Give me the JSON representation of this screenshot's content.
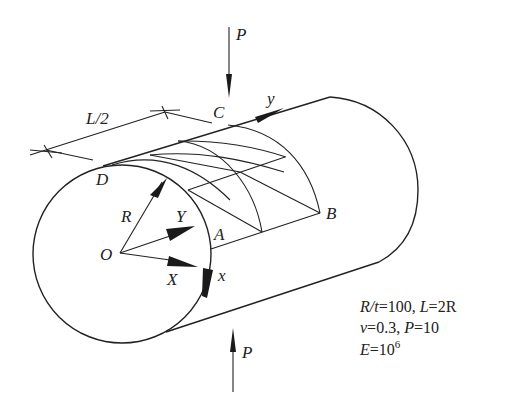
{
  "diagram": {
    "type": "cylindrical shell under pinching loads",
    "labels": {
      "load_top": "P",
      "load_bottom": "P",
      "point_A": "A",
      "point_B": "B",
      "point_C": "C",
      "point_D": "D",
      "origin": "O",
      "radius": "R",
      "global_X": "X",
      "global_Y": "Y",
      "local_x": "x",
      "local_y": "y",
      "half_length": "L/2"
    },
    "parameters": {
      "line1_a": "R/t",
      "line1_b": "=100, ",
      "line1_c": "L",
      "line1_d": "=2R",
      "line2_a": "ν",
      "line2_b": "=0.3, ",
      "line2_c": "P",
      "line2_d": "=10",
      "line3_a": "E",
      "line3_b": "=10",
      "line3_exp": "6"
    },
    "colors": {
      "stroke": "#222222",
      "background": "#ffffff"
    }
  }
}
